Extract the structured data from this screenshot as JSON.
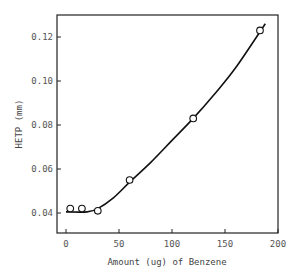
{
  "chart_data": {
    "type": "scatter",
    "title": "",
    "xlabel": "Amount (ug) of Benzene",
    "ylabel": "HETP (mm)",
    "xlim": [
      -8,
      200
    ],
    "ylim": [
      0.03,
      0.13
    ],
    "x_ticks": [
      0,
      50,
      100,
      150,
      200
    ],
    "y_ticks": [
      0.04,
      0.06,
      0.08,
      0.1,
      0.12
    ],
    "x_tick_labels": [
      "0",
      "50",
      "100",
      "150",
      "200"
    ],
    "y_tick_labels": [
      "0.04",
      "0.06",
      "0.08",
      "0.10",
      "0.12"
    ],
    "grid": false,
    "legend": null,
    "series": [
      {
        "name": "measured",
        "marker": "open-circle",
        "x": [
          4,
          15,
          30,
          60,
          120,
          183
        ],
        "y": [
          0.042,
          0.042,
          0.041,
          0.055,
          0.083,
          0.123
        ]
      },
      {
        "name": "fitted curve",
        "style": "solid-line",
        "x": [
          0,
          20,
          30,
          45,
          60,
          80,
          100,
          120,
          140,
          160,
          188
        ],
        "y": [
          0.0405,
          0.0405,
          0.042,
          0.047,
          0.054,
          0.063,
          0.073,
          0.083,
          0.094,
          0.106,
          0.126
        ]
      }
    ]
  }
}
